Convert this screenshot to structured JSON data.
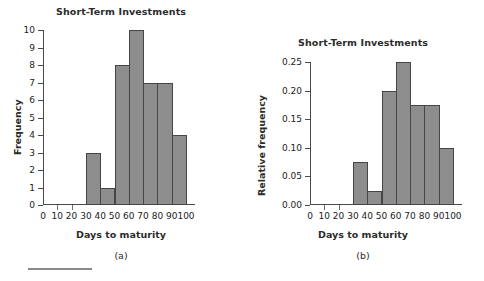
{
  "figure": {
    "footer_rule": "horizontal-rule"
  },
  "chart_data": [
    {
      "type": "bar",
      "id": "a",
      "title": "Short-Term Investments",
      "caption": "(a)",
      "xlabel": "Days to maturity",
      "ylabel": "Frequency",
      "xlim": [
        0,
        100
      ],
      "ylim": [
        0,
        10
      ],
      "grid": false,
      "legend": "none",
      "xticks": [
        "0",
        "10",
        "20",
        "30",
        "40",
        "50",
        "60",
        "70",
        "80",
        "90",
        "100"
      ],
      "xtick_values": [
        0,
        10,
        20,
        30,
        40,
        50,
        60,
        70,
        80,
        90,
        100
      ],
      "yticks": [
        "0",
        "1",
        "2",
        "3",
        "4",
        "5",
        "6",
        "7",
        "8",
        "9",
        "10"
      ],
      "ytick_values": [
        0,
        1,
        2,
        3,
        4,
        5,
        6,
        7,
        8,
        9,
        10
      ],
      "bin_edges": [
        30,
        40,
        50,
        60,
        70,
        80,
        90,
        100
      ],
      "categories": [
        "30-40",
        "40-50",
        "50-60",
        "60-70",
        "70-80",
        "80-90",
        "90-100"
      ],
      "values": [
        3,
        1,
        8,
        10,
        7,
        7,
        4
      ],
      "bar_color": "#8d8d8d",
      "bar_edge_color": "#454545"
    },
    {
      "type": "bar",
      "id": "b",
      "title": "Short-Term Investments",
      "caption": "(b)",
      "xlabel": "Days to maturity",
      "ylabel": "Relative frequency",
      "xlim": [
        0,
        100
      ],
      "ylim": [
        0,
        0.25
      ],
      "grid": false,
      "legend": "none",
      "xticks": [
        "0",
        "10",
        "20",
        "30",
        "40",
        "50",
        "60",
        "70",
        "80",
        "90",
        "100"
      ],
      "xtick_values": [
        0,
        10,
        20,
        30,
        40,
        50,
        60,
        70,
        80,
        90,
        100
      ],
      "yticks": [
        "0.00",
        "0.05",
        "0.10",
        "0.15",
        "0.20",
        "0.25"
      ],
      "ytick_values": [
        0,
        0.05,
        0.1,
        0.15,
        0.2,
        0.25
      ],
      "bin_edges": [
        30,
        40,
        50,
        60,
        70,
        80,
        90,
        100
      ],
      "categories": [
        "30-40",
        "40-50",
        "50-60",
        "60-70",
        "70-80",
        "80-90",
        "90-100"
      ],
      "values": [
        0.075,
        0.025,
        0.2,
        0.25,
        0.175,
        0.175,
        0.1
      ],
      "bar_color": "#8d8d8d",
      "bar_edge_color": "#454545"
    }
  ]
}
